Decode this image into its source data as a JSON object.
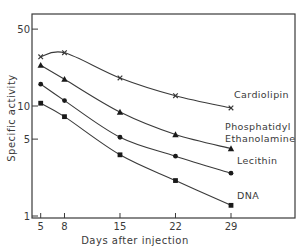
{
  "chart_data": {
    "type": "line",
    "title": "",
    "xlabel": "Days after injection",
    "ylabel": "Specific activity",
    "yscale": "log",
    "ylim": [
      1,
      70
    ],
    "xlim": [
      3.7,
      37
    ],
    "grid": false,
    "legend_position": "inline labels at line ends",
    "x": [
      5,
      8,
      15,
      22,
      29
    ],
    "x_ticks": [
      5,
      8,
      15,
      22,
      29
    ],
    "y_ticks": [
      1,
      5,
      10,
      50
    ],
    "series": [
      {
        "name": "Cardiolipin",
        "label_lines": [
          "Cardiolipin"
        ],
        "marker": "x",
        "values": [
          28,
          30.5,
          18,
          12.4,
          9.6
        ]
      },
      {
        "name": "Phosphatidyl Ethanolamine",
        "label_lines": [
          "Phosphatidyl",
          "Ethanolamine"
        ],
        "marker": "triangle",
        "values": [
          23.5,
          17.5,
          8.8,
          5.5,
          4.1
        ]
      },
      {
        "name": "Lecithin",
        "label_lines": [
          "Lecithin"
        ],
        "marker": "circle",
        "values": [
          15.8,
          11.2,
          5.2,
          3.5,
          2.45
        ]
      },
      {
        "name": "DNA",
        "label_lines": [
          "DNA"
        ],
        "marker": "square",
        "values": [
          10.6,
          8.0,
          3.6,
          2.1,
          1.25
        ]
      }
    ]
  },
  "colors": {
    "ink": "#3a3a3a",
    "background": "#ffffff"
  }
}
